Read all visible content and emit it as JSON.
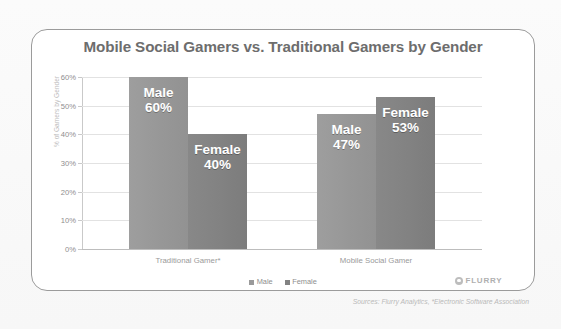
{
  "chart_data": {
    "type": "bar",
    "title": "Mobile Social Gamers vs. Traditional Gamers by Gender",
    "categories": [
      "Traditional Gamer*",
      "Mobile Social Gamer"
    ],
    "series": [
      {
        "name": "Male",
        "values": [
          60,
          47
        ],
        "color": "#9a9a9a"
      },
      {
        "name": "Female",
        "values": [
          40,
          53
        ],
        "color": "#828282"
      }
    ],
    "xlabel": "",
    "ylabel": "% of Gamers by Gender",
    "ylim": [
      0,
      60
    ],
    "ytick_labels": [
      "60%",
      "50%",
      "40%",
      "30%",
      "20%",
      "10%",
      "0%"
    ],
    "ytick_values": [
      60,
      50,
      40,
      30,
      20,
      10,
      0
    ],
    "grid": true,
    "legend_position": "bottom",
    "data_labels": [
      {
        "series": "Male",
        "category": "Traditional Gamer*",
        "text": "Male",
        "value_text": "60%"
      },
      {
        "series": "Female",
        "category": "Traditional Gamer*",
        "text": "Female",
        "value_text": "40%"
      },
      {
        "series": "Male",
        "category": "Mobile Social Gamer",
        "text": "Male",
        "value_text": "47%"
      },
      {
        "series": "Female",
        "category": "Mobile Social Gamer",
        "text": "Female",
        "value_text": "53%"
      }
    ]
  },
  "legend": {
    "items": [
      {
        "label": "Male"
      },
      {
        "label": "Female"
      }
    ]
  },
  "branding": {
    "wordmark": "FLURRY"
  },
  "footer": {
    "sources": "Sources: Flurry Analytics, *Electronic Software Association"
  }
}
